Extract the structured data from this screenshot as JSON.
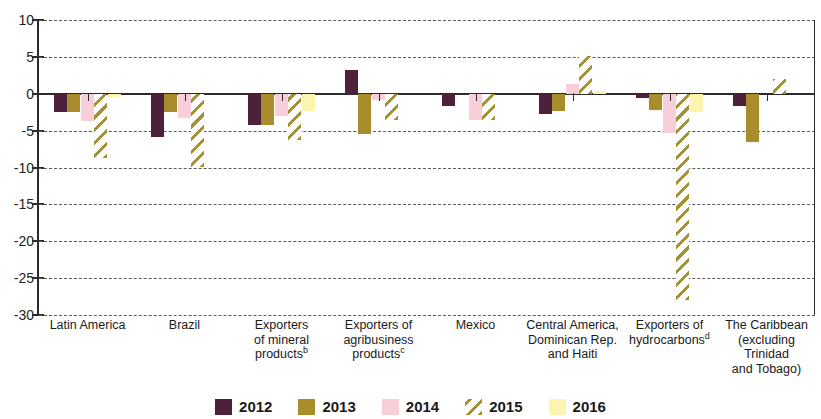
{
  "chart_data": {
    "type": "bar",
    "title": "",
    "subtitle": "",
    "xlabel": "",
    "ylabel": "",
    "ylim": [
      -30,
      10
    ],
    "ytick_values": [
      10,
      5,
      0,
      -5,
      -10,
      -15,
      -20,
      -25,
      -30
    ],
    "ytick_labels": [
      "10",
      "5",
      "0",
      "-5",
      "-10",
      "-15",
      "-20",
      "-25",
      "-30"
    ],
    "grid": true,
    "grid_style": "dashed horizontal",
    "legend_position": "bottom-center",
    "orientation": "vertical",
    "grouped": true,
    "categories": [
      "Latin America",
      "Brazil",
      "Exporters of mineral products",
      "Exporters of agribusiness products",
      "Mexico",
      "Central America, Dominican Rep. and Haiti",
      "Exporters of hydrocarbons",
      "The Caribbean (excluding Trinidad and Tobago)"
    ],
    "category_label_lines": [
      [
        "Latin America"
      ],
      [
        "Brazil"
      ],
      [
        "Exporters",
        "of mineral",
        "products"
      ],
      [
        "Exporters of",
        "agribusiness",
        "products"
      ],
      [
        "Mexico"
      ],
      [
        "Central America,",
        "Dominican Rep.",
        "and Haiti"
      ],
      [
        "Exporters of",
        "hydrocarbons"
      ],
      [
        "The Caribbean",
        "(excluding",
        "Trinidad",
        "and Tobago)"
      ]
    ],
    "category_footnotes": [
      "",
      "",
      "b",
      "c",
      "",
      "",
      "d",
      ""
    ],
    "series": [
      {
        "name": "2012",
        "color": "#4d203c",
        "pattern": "solid",
        "values": [
          -2.5,
          -5.8,
          -4.3,
          3.2,
          -1.7,
          -2.8,
          -0.6,
          -1.7
        ]
      },
      {
        "name": "2013",
        "color": "#a98c2b",
        "pattern": "solid",
        "values": [
          -2.5,
          -2.5,
          -4.3,
          -5.5,
          null,
          -2.3,
          -2.2,
          -6.5
        ]
      },
      {
        "name": "2014",
        "color": "#f8cfd8",
        "pattern": "solid",
        "values": [
          -3.7,
          -3.3,
          -3.0,
          -0.8,
          -3.5,
          1.3,
          -5.3,
          null
        ]
      },
      {
        "name": "2015",
        "color": "#a39330",
        "pattern": "diagonal-hatch",
        "values": [
          -8.7,
          -9.9,
          -6.3,
          -3.6,
          -3.5,
          5.1,
          -28.0,
          2.0
        ]
      },
      {
        "name": "2016",
        "color": "#fbf5b0",
        "pattern": "solid",
        "values": [
          -0.4,
          null,
          -2.3,
          null,
          null,
          0.4,
          -2.5,
          null
        ]
      }
    ]
  },
  "legend": {
    "items": [
      {
        "label": "2012",
        "swatch": "legend-swatch-2012"
      },
      {
        "label": "2013",
        "swatch": "legend-swatch-2013"
      },
      {
        "label": "2014",
        "swatch": "legend-swatch-2014"
      },
      {
        "label": "2015",
        "swatch": "legend-swatch-2015"
      },
      {
        "label": "2016",
        "swatch": "legend-swatch-2016"
      }
    ]
  }
}
